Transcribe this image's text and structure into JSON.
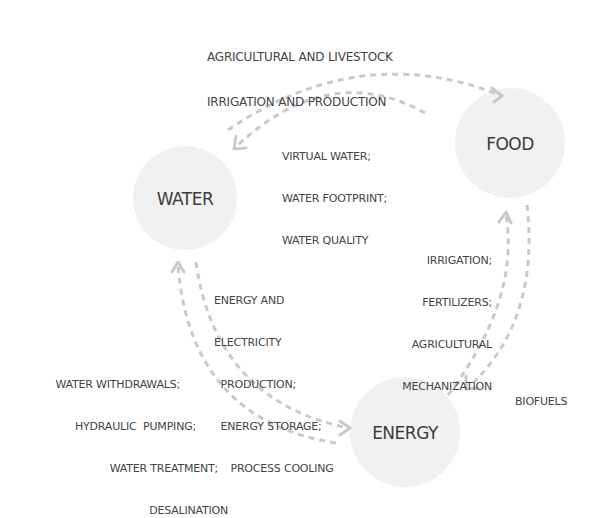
{
  "nodes": {
    "water": "WATER",
    "food": "FOOD",
    "energy": "ENERGY"
  },
  "flows": {
    "water_to_food": [
      "AGRICULTURAL AND LIVESTOCK",
      "IRRIGATION AND PRODUCTION"
    ],
    "food_to_water": [
      "VIRTUAL WATER;",
      "WATER FOOTPRINT;",
      "WATER QUALITY"
    ],
    "energy_to_food": [
      "IRRIGATION;",
      "FERTILIZERS;",
      "AGRICULTURAL",
      "MECHANIZATION"
    ],
    "food_to_energy": [
      "BIOFUELS"
    ],
    "water_to_energy": [
      "ENERGY AND",
      "ELECTRICITY",
      "  PRODUCTION;",
      "  ENERGY STORAGE;",
      "     PROCESS COOLING"
    ],
    "energy_to_water": [
      "WATER WITHDRAWALS;",
      "HYDRAULIC  PUMPING;",
      "WATER TREATMENT;",
      "DESALINATION"
    ]
  }
}
